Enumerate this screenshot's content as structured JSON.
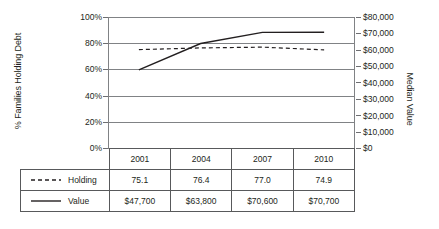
{
  "chart_data": {
    "type": "line",
    "title": "",
    "categories": [
      "2001",
      "2004",
      "2007",
      "2010"
    ],
    "series": [
      {
        "name": "Holding",
        "axis": "left",
        "style": "dashed",
        "values": [
          75.1,
          76.4,
          77.0,
          74.9
        ],
        "display_values": [
          "75.1",
          "76.4",
          "77.0",
          "74.9"
        ]
      },
      {
        "name": "Value",
        "axis": "right",
        "style": "solid",
        "values": [
          47700,
          63800,
          70600,
          70700
        ],
        "display_values": [
          "$47,700",
          "$63,800",
          "$70,600",
          "$70,700"
        ]
      }
    ],
    "left_axis": {
      "label": "% Families Holding Debt",
      "ticks": [
        "0%",
        "20%",
        "40%",
        "60%",
        "80%",
        "100%"
      ],
      "min": 0,
      "max": 100
    },
    "right_axis": {
      "label": "Median Value",
      "ticks": [
        "$0",
        "$10,000",
        "$20,000",
        "$30,000",
        "$40,000",
        "$50,000",
        "$60,000",
        "$70,000",
        "$80,000"
      ],
      "min": 0,
      "max": 80000
    },
    "xlabel": "",
    "grid": true,
    "legend_position": "table-below"
  },
  "axes": {
    "left_title": "% Families Holding Debt",
    "right_title": "Median Value",
    "left_ticks": [
      {
        "label": "100%",
        "value": 100
      },
      {
        "label": "80%",
        "value": 80
      },
      {
        "label": "60%",
        "value": 60
      },
      {
        "label": "40%",
        "value": 40
      },
      {
        "label": "20%",
        "value": 20
      },
      {
        "label": "0%",
        "value": 0
      }
    ],
    "right_ticks": [
      {
        "label": "$80,000",
        "value": 80000
      },
      {
        "label": "$70,000",
        "value": 70000
      },
      {
        "label": "$60,000",
        "value": 60000
      },
      {
        "label": "$50,000",
        "value": 50000
      },
      {
        "label": "$40,000",
        "value": 40000
      },
      {
        "label": "$30,000",
        "value": 30000
      },
      {
        "label": "$20,000",
        "value": 20000
      },
      {
        "label": "$10,000",
        "value": 10000
      },
      {
        "label": "$0",
        "value": 0
      }
    ]
  },
  "table": {
    "years": [
      "2001",
      "2004",
      "2007",
      "2010"
    ],
    "rows": [
      {
        "label": "Holding",
        "line_style": "dashed",
        "cells": [
          "75.1",
          "76.4",
          "77.0",
          "74.9"
        ]
      },
      {
        "label": "Value",
        "line_style": "solid",
        "cells": [
          "$47,700",
          "$63,800",
          "$70,600",
          "$70,700"
        ]
      }
    ]
  },
  "colors": {
    "line": "#231f20",
    "grid": "#808285",
    "table_border": "#58595b",
    "text": "#231f20",
    "background": "#ffffff"
  }
}
